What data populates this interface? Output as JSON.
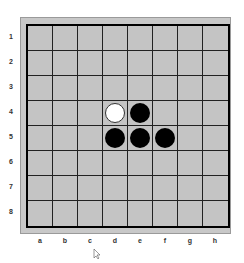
{
  "board": {
    "rows": [
      "1",
      "2",
      "3",
      "4",
      "5",
      "6",
      "7",
      "8"
    ],
    "cols": [
      "a",
      "b",
      "c",
      "d",
      "e",
      "f",
      "g",
      "h"
    ],
    "pieces": [
      {
        "square": "d4",
        "color": "white"
      },
      {
        "square": "e4",
        "color": "black"
      },
      {
        "square": "d5",
        "color": "black"
      },
      {
        "square": "e5",
        "color": "black"
      },
      {
        "square": "f5",
        "color": "black"
      }
    ]
  },
  "colors": {
    "board": "#c4c4c4",
    "grid": "#222222",
    "black": "#000000",
    "white": "#ffffff"
  }
}
